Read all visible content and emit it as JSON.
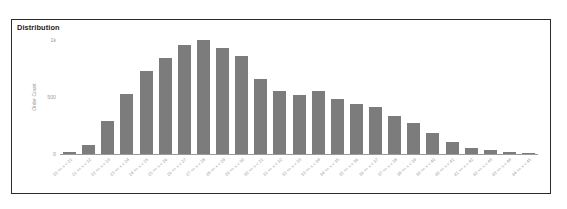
{
  "card": {
    "title": "Distribution",
    "border_color": "#2b2b2b",
    "background": "#ffffff"
  },
  "chart_data": {
    "type": "bar",
    "title": "Distribution",
    "xlabel": "",
    "ylabel": "Order Count",
    "bar_color": "#7c7c7c",
    "grid": false,
    "legend": false,
    "ylim": [
      0,
      1000
    ],
    "y_ticks": [
      {
        "value": 1000,
        "label": "1k"
      },
      {
        "value": 500,
        "label": "500"
      },
      {
        "value": 0,
        "label": "0"
      }
    ],
    "categories": [
      "20 <= x < 21",
      "21 <= x < 22",
      "22 <= x < 23",
      "23 <= x < 24",
      "24 <= x < 25",
      "25 <= x < 26",
      "26 <= x < 27",
      "27 <= x < 28",
      "28 <= x < 29",
      "29 <= x < 30",
      "30 <= x < 31",
      "31 <= x < 32",
      "32 <= x < 33",
      "33 <= x < 34",
      "34 <= x < 35",
      "35 <= x < 36",
      "36 <= x < 37",
      "37 <= x < 38",
      "38 <= x < 39",
      "39 <= x < 40",
      "40 <= x < 41",
      "41 <= x < 42",
      "42 <= x < 43",
      "43 <= x < 44",
      "44 <= x < 45"
    ],
    "values": [
      15,
      75,
      290,
      530,
      730,
      840,
      960,
      1000,
      930,
      860,
      660,
      555,
      520,
      555,
      480,
      440,
      415,
      330,
      275,
      185,
      105,
      55,
      35,
      18,
      8
    ]
  }
}
